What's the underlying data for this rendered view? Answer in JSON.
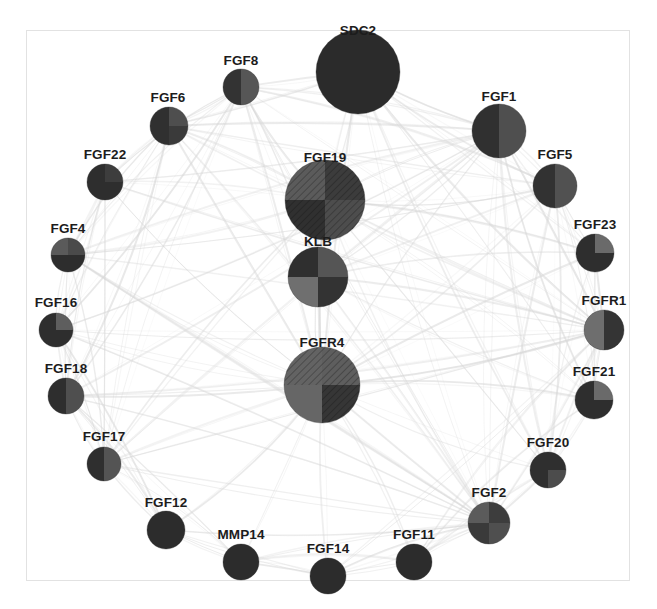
{
  "figure": {
    "type": "network-graph",
    "title": "",
    "background_color": "#ffffff",
    "frame_color": "#e2e2e2",
    "edge_color": "#d8d8d8",
    "label_color": "#1c1c1c",
    "node_count": 24,
    "edge_style": "curved-translucent-gray"
  },
  "palette": {
    "very_dark": "#2b2b2b",
    "dark": "#333333",
    "mid_dark": "#4a4a4a",
    "mid": "#5e5e5e",
    "mid_light": "#7a7a7a",
    "light": "#9a9a9a",
    "hatch_line": "#1f1f1f"
  },
  "nodes": [
    {
      "id": "SDC2",
      "label": "SDC2",
      "cx": 358,
      "cy": 72,
      "r": 42,
      "label_x": 358,
      "label_y": 38,
      "quadrants": [
        "#2b2b2b",
        "#2b2b2b",
        "#2b2b2b",
        "#2b2b2b"
      ],
      "hatch": [
        false,
        false,
        false,
        false
      ]
    },
    {
      "id": "FGF19",
      "label": "FGF19",
      "cx": 325,
      "cy": 200,
      "r": 40,
      "label_x": 325,
      "label_y": 165,
      "quadrants": [
        "#5b5b5b",
        "#3c3c3c",
        "#303030",
        "#4d4d4d"
      ],
      "hatch": [
        true,
        true,
        true,
        true
      ]
    },
    {
      "id": "KLB",
      "label": "KLB",
      "cx": 318,
      "cy": 277,
      "r": 30,
      "label_x": 318,
      "label_y": 249,
      "quadrants": [
        "#2f2f2f",
        "#555555",
        "#6f6f6f",
        "#333333"
      ],
      "hatch": [
        false,
        false,
        false,
        false
      ]
    },
    {
      "id": "FGFR4",
      "label": "FGFR4",
      "cx": 322,
      "cy": 385,
      "r": 38,
      "label_x": 322,
      "label_y": 350,
      "quadrants": [
        "#636363",
        "#5e5e5e",
        "#666666",
        "#363636"
      ],
      "hatch": [
        true,
        true,
        false,
        true
      ]
    },
    {
      "id": "FGF8",
      "label": "FGF8",
      "cx": 241,
      "cy": 87,
      "r": 18,
      "label_x": 241,
      "label_y": 68,
      "quadrants": [
        "#333333",
        "#565656",
        "#333333",
        "#565656"
      ],
      "hatch": [
        false,
        false,
        false,
        false
      ]
    },
    {
      "id": "FGF6",
      "label": "FGF6",
      "cx": 169,
      "cy": 126,
      "r": 19,
      "label_x": 168,
      "label_y": 105,
      "quadrants": [
        "#303030",
        "#4e4e4e",
        "#303030",
        "#3a3a3a"
      ],
      "hatch": [
        false,
        false,
        false,
        false
      ]
    },
    {
      "id": "FGF22",
      "label": "FGF22",
      "cx": 105,
      "cy": 182,
      "r": 18,
      "label_x": 105,
      "label_y": 162,
      "quadrants": [
        "#2e2e2e",
        "#3d3d3d",
        "#2e2e2e",
        "#2e2e2e"
      ],
      "hatch": [
        false,
        false,
        false,
        false
      ]
    },
    {
      "id": "FGF4",
      "label": "FGF4",
      "cx": 68,
      "cy": 255,
      "r": 17,
      "label_x": 68,
      "label_y": 236,
      "quadrants": [
        "#5a5a5a",
        "#4a4a4a",
        "#2d2d2d",
        "#2d2d2d"
      ],
      "hatch": [
        false,
        false,
        false,
        false
      ]
    },
    {
      "id": "FGF16",
      "label": "FGF16",
      "cx": 56,
      "cy": 330,
      "r": 17,
      "label_x": 56,
      "label_y": 310,
      "quadrants": [
        "#2e2e2e",
        "#5e5e5e",
        "#2e2e2e",
        "#2e2e2e"
      ],
      "hatch": [
        false,
        false,
        false,
        false
      ]
    },
    {
      "id": "FGF18",
      "label": "FGF18",
      "cx": 66,
      "cy": 396,
      "r": 18,
      "label_x": 66,
      "label_y": 376,
      "quadrants": [
        "#2e2e2e",
        "#4f4f4f",
        "#2e2e2e",
        "#4f4f4f"
      ],
      "hatch": [
        false,
        false,
        false,
        false
      ]
    },
    {
      "id": "FGF17",
      "label": "FGF17",
      "cx": 104,
      "cy": 464,
      "r": 17,
      "label_x": 104,
      "label_y": 444,
      "quadrants": [
        "#2f2f2f",
        "#545454",
        "#2f2f2f",
        "#545454"
      ],
      "hatch": [
        false,
        false,
        false,
        false
      ]
    },
    {
      "id": "FGF12",
      "label": "FGF12",
      "cx": 166,
      "cy": 530,
      "r": 19,
      "label_x": 166,
      "label_y": 510,
      "quadrants": [
        "#2c2c2c",
        "#2c2c2c",
        "#2c2c2c",
        "#2c2c2c"
      ],
      "hatch": [
        false,
        false,
        false,
        false
      ]
    },
    {
      "id": "MMP14",
      "label": "MMP14",
      "cx": 241,
      "cy": 562,
      "r": 18,
      "label_x": 241,
      "label_y": 542,
      "quadrants": [
        "#2c2c2c",
        "#2c2c2c",
        "#2c2c2c",
        "#2c2c2c"
      ],
      "hatch": [
        false,
        false,
        false,
        false
      ]
    },
    {
      "id": "FGF14",
      "label": "FGF14",
      "cx": 328,
      "cy": 576,
      "r": 18,
      "label_x": 328,
      "label_y": 556,
      "quadrants": [
        "#2c2c2c",
        "#2c2c2c",
        "#2c2c2c",
        "#2c2c2c"
      ],
      "hatch": [
        false,
        false,
        false,
        false
      ]
    },
    {
      "id": "FGF11",
      "label": "FGF11",
      "cx": 414,
      "cy": 562,
      "r": 18,
      "label_x": 414,
      "label_y": 542,
      "quadrants": [
        "#2c2c2c",
        "#2c2c2c",
        "#2c2c2c",
        "#2c2c2c"
      ],
      "hatch": [
        false,
        false,
        false,
        false
      ]
    },
    {
      "id": "FGF2",
      "label": "FGF2",
      "cx": 489,
      "cy": 523,
      "r": 21,
      "label_x": 489,
      "label_y": 500,
      "quadrants": [
        "#5b5b5b",
        "#3d3d3d",
        "#3a3a3a",
        "#4f4f4f"
      ],
      "hatch": [
        false,
        false,
        false,
        false
      ]
    },
    {
      "id": "FGF20",
      "label": "FGF20",
      "cx": 548,
      "cy": 470,
      "r": 18,
      "label_x": 548,
      "label_y": 450,
      "quadrants": [
        "#2f2f2f",
        "#2f2f2f",
        "#2f2f2f",
        "#4c4c4c"
      ],
      "hatch": [
        false,
        false,
        false,
        false
      ]
    },
    {
      "id": "FGF21",
      "label": "FGF21",
      "cx": 594,
      "cy": 400,
      "r": 19,
      "label_x": 594,
      "label_y": 379,
      "quadrants": [
        "#2e2e2e",
        "#6a6a6a",
        "#2e2e2e",
        "#2e2e2e"
      ],
      "hatch": [
        false,
        false,
        false,
        false
      ]
    },
    {
      "id": "FGFR1",
      "label": "FGFR1",
      "cx": 604,
      "cy": 330,
      "r": 20,
      "label_x": 604,
      "label_y": 308,
      "quadrants": [
        "#6e6e6e",
        "#343434",
        "#6e6e6e",
        "#343434"
      ],
      "hatch": [
        false,
        false,
        false,
        false
      ]
    },
    {
      "id": "FGF23",
      "label": "FGF23",
      "cx": 595,
      "cy": 253,
      "r": 19,
      "label_x": 595,
      "label_y": 232,
      "quadrants": [
        "#2e2e2e",
        "#6a6a6a",
        "#2e2e2e",
        "#2e2e2e"
      ],
      "hatch": [
        false,
        false,
        false,
        false
      ]
    },
    {
      "id": "FGF5",
      "label": "FGF5",
      "cx": 555,
      "cy": 186,
      "r": 22,
      "label_x": 555,
      "label_y": 162,
      "quadrants": [
        "#323232",
        "#515151",
        "#323232",
        "#515151"
      ],
      "hatch": [
        false,
        false,
        false,
        false
      ]
    },
    {
      "id": "FGF1",
      "label": "FGF1",
      "cx": 499,
      "cy": 131,
      "r": 27,
      "label_x": 499,
      "label_y": 104,
      "quadrants": [
        "#303030",
        "#4f4f4f",
        "#303030",
        "#4f4f4f"
      ],
      "hatch": [
        false,
        false,
        false,
        false
      ]
    }
  ],
  "edges": [
    {
      "source": "SDC2",
      "target": "FGF19"
    },
    {
      "source": "SDC2",
      "target": "KLB"
    },
    {
      "source": "SDC2",
      "target": "FGFR4"
    },
    {
      "source": "SDC2",
      "target": "FGF1"
    },
    {
      "source": "SDC2",
      "target": "FGF8"
    },
    {
      "source": "SDC2",
      "target": "FGF2"
    },
    {
      "source": "SDC2",
      "target": "FGFR1"
    },
    {
      "source": "SDC2",
      "target": "FGF5"
    },
    {
      "source": "FGF19",
      "target": "KLB"
    },
    {
      "source": "FGF19",
      "target": "FGFR4"
    },
    {
      "source": "FGF19",
      "target": "FGFR1"
    },
    {
      "source": "FGF19",
      "target": "FGF1"
    },
    {
      "source": "FGF19",
      "target": "FGF2"
    },
    {
      "source": "FGF19",
      "target": "FGF8"
    },
    {
      "source": "FGF19",
      "target": "FGF6"
    },
    {
      "source": "FGF19",
      "target": "FGF23"
    },
    {
      "source": "FGF19",
      "target": "FGF21"
    },
    {
      "source": "KLB",
      "target": "FGFR4"
    },
    {
      "source": "KLB",
      "target": "FGFR1"
    },
    {
      "source": "KLB",
      "target": "FGF21"
    },
    {
      "source": "KLB",
      "target": "FGF23"
    },
    {
      "source": "KLB",
      "target": "FGF2"
    },
    {
      "source": "FGFR4",
      "target": "FGFR1"
    },
    {
      "source": "FGFR4",
      "target": "FGF1"
    },
    {
      "source": "FGFR4",
      "target": "FGF2"
    },
    {
      "source": "FGFR4",
      "target": "FGF8"
    },
    {
      "source": "FGFR4",
      "target": "FGF6"
    },
    {
      "source": "FGFR4",
      "target": "FGF4"
    },
    {
      "source": "FGFR4",
      "target": "FGF16"
    },
    {
      "source": "FGFR4",
      "target": "FGF18"
    },
    {
      "source": "FGFR4",
      "target": "FGF17"
    },
    {
      "source": "FGFR4",
      "target": "FGF12"
    },
    {
      "source": "FGFR4",
      "target": "MMP14"
    },
    {
      "source": "FGFR4",
      "target": "FGF14"
    },
    {
      "source": "FGFR4",
      "target": "FGF11"
    },
    {
      "source": "FGFR4",
      "target": "FGF20"
    },
    {
      "source": "FGFR4",
      "target": "FGF21"
    },
    {
      "source": "FGFR4",
      "target": "FGF23"
    },
    {
      "source": "FGFR4",
      "target": "FGF5"
    },
    {
      "source": "FGFR4",
      "target": "FGF22"
    },
    {
      "source": "FGFR1",
      "target": "FGF1"
    },
    {
      "source": "FGFR1",
      "target": "FGF2"
    },
    {
      "source": "FGFR1",
      "target": "FGF5"
    },
    {
      "source": "FGFR1",
      "target": "FGF23"
    },
    {
      "source": "FGFR1",
      "target": "FGF21"
    },
    {
      "source": "FGFR1",
      "target": "FGF20"
    },
    {
      "source": "FGFR1",
      "target": "FGF8"
    },
    {
      "source": "FGFR1",
      "target": "FGF6"
    },
    {
      "source": "FGFR1",
      "target": "FGF4"
    },
    {
      "source": "FGFR1",
      "target": "FGF16"
    },
    {
      "source": "FGFR1",
      "target": "FGF17"
    },
    {
      "source": "FGFR1",
      "target": "FGF18"
    },
    {
      "source": "FGFR1",
      "target": "FGF22"
    },
    {
      "source": "FGFR1",
      "target": "FGF11"
    },
    {
      "source": "FGFR1",
      "target": "FGF14"
    },
    {
      "source": "FGF2",
      "target": "FGF1"
    },
    {
      "source": "FGF2",
      "target": "FGF5"
    },
    {
      "source": "FGF2",
      "target": "FGF8"
    },
    {
      "source": "FGF2",
      "target": "FGF6"
    },
    {
      "source": "FGF2",
      "target": "FGF4"
    },
    {
      "source": "FGF2",
      "target": "FGF16"
    },
    {
      "source": "FGF2",
      "target": "FGF17"
    },
    {
      "source": "FGF2",
      "target": "FGF18"
    },
    {
      "source": "FGF2",
      "target": "FGF20"
    },
    {
      "source": "FGF2",
      "target": "FGF11"
    },
    {
      "source": "FGF2",
      "target": "FGF14"
    },
    {
      "source": "FGF2",
      "target": "MMP14"
    },
    {
      "source": "FGF2",
      "target": "FGF12"
    },
    {
      "source": "FGF1",
      "target": "FGF5"
    },
    {
      "source": "FGF1",
      "target": "FGF8"
    },
    {
      "source": "FGF1",
      "target": "FGF6"
    },
    {
      "source": "FGF1",
      "target": "FGF4"
    },
    {
      "source": "FGF1",
      "target": "FGF16"
    },
    {
      "source": "FGF1",
      "target": "FGF18"
    },
    {
      "source": "FGF1",
      "target": "FGF17"
    },
    {
      "source": "FGF1",
      "target": "FGF22"
    },
    {
      "source": "FGF1",
      "target": "FGF23"
    },
    {
      "source": "FGF1",
      "target": "FGF21"
    },
    {
      "source": "FGF1",
      "target": "FGF20"
    },
    {
      "source": "FGF8",
      "target": "FGF6"
    },
    {
      "source": "FGF8",
      "target": "FGF22"
    },
    {
      "source": "FGF8",
      "target": "FGF4"
    },
    {
      "source": "FGF8",
      "target": "FGF17"
    },
    {
      "source": "FGF8",
      "target": "FGF18"
    },
    {
      "source": "FGF8",
      "target": "FGF5"
    },
    {
      "source": "FGF6",
      "target": "FGF22"
    },
    {
      "source": "FGF6",
      "target": "FGF4"
    },
    {
      "source": "FGF6",
      "target": "FGF16"
    },
    {
      "source": "FGF6",
      "target": "FGF18"
    },
    {
      "source": "FGF6",
      "target": "FGF17"
    },
    {
      "source": "FGF22",
      "target": "FGF4"
    },
    {
      "source": "FGF22",
      "target": "FGF16"
    },
    {
      "source": "FGF22",
      "target": "FGF18"
    },
    {
      "source": "FGF4",
      "target": "FGF16"
    },
    {
      "source": "FGF4",
      "target": "FGF18"
    },
    {
      "source": "FGF4",
      "target": "FGF17"
    },
    {
      "source": "FGF4",
      "target": "FGF5"
    },
    {
      "source": "FGF16",
      "target": "FGF18"
    },
    {
      "source": "FGF16",
      "target": "FGF17"
    },
    {
      "source": "FGF18",
      "target": "FGF17"
    },
    {
      "source": "FGF18",
      "target": "FGF12"
    },
    {
      "source": "FGF17",
      "target": "FGF12"
    },
    {
      "source": "FGF17",
      "target": "MMP14"
    },
    {
      "source": "FGF12",
      "target": "MMP14"
    },
    {
      "source": "MMP14",
      "target": "FGF14"
    },
    {
      "source": "FGF14",
      "target": "FGF11"
    },
    {
      "source": "FGF11",
      "target": "FGF20"
    },
    {
      "source": "FGF20",
      "target": "FGF21"
    },
    {
      "source": "FGF21",
      "target": "FGF23"
    },
    {
      "source": "FGF23",
      "target": "FGF5"
    },
    {
      "source": "FGF5",
      "target": "FGF21"
    },
    {
      "source": "FGF5",
      "target": "FGF20"
    },
    {
      "source": "FGF23",
      "target": "FGF20"
    },
    {
      "source": "FGF8",
      "target": "FGF16"
    },
    {
      "source": "FGF6",
      "target": "FGF5"
    },
    {
      "source": "FGF22",
      "target": "FGF17"
    },
    {
      "source": "FGF4",
      "target": "FGF2"
    },
    {
      "source": "FGF16",
      "target": "FGF12"
    },
    {
      "source": "FGF18",
      "target": "MMP14"
    },
    {
      "source": "FGF12",
      "target": "FGF14"
    },
    {
      "source": "MMP14",
      "target": "FGF11"
    },
    {
      "source": "FGF14",
      "target": "FGF2"
    },
    {
      "source": "FGF11",
      "target": "FGF21"
    },
    {
      "source": "SDC2",
      "target": "FGF6"
    },
    {
      "source": "SDC2",
      "target": "FGF23"
    },
    {
      "source": "SDC2",
      "target": "FGF21"
    },
    {
      "source": "SDC2",
      "target": "FGF20"
    },
    {
      "source": "KLB",
      "target": "FGF1"
    },
    {
      "source": "KLB",
      "target": "FGF5"
    },
    {
      "source": "KLB",
      "target": "FGF8"
    },
    {
      "source": "FGF19",
      "target": "FGF5"
    },
    {
      "source": "FGF19",
      "target": "FGF20"
    },
    {
      "source": "FGF19",
      "target": "FGF4"
    },
    {
      "source": "FGF19",
      "target": "FGF22"
    },
    {
      "source": "FGF19",
      "target": "FGF17"
    },
    {
      "source": "FGFR4",
      "target": "FGF19"
    }
  ]
}
